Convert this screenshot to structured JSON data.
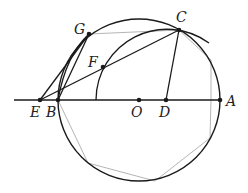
{
  "diagram": {
    "type": "geometry-construction",
    "colors": {
      "ink": "#1a1a1a",
      "polygon": "#b5b5b5",
      "background": "#ffffff"
    },
    "points": [
      {
        "id": "E",
        "label": "E",
        "x": 40,
        "y": 100,
        "label_x": 30,
        "label_y": 117
      },
      {
        "id": "B",
        "label": "B",
        "x": 58,
        "y": 100,
        "label_x": 46,
        "label_y": 117
      },
      {
        "id": "O",
        "label": "O",
        "x": 139,
        "y": 100,
        "label_x": 131,
        "label_y": 117
      },
      {
        "id": "D",
        "label": "D",
        "x": 166,
        "y": 100,
        "label_x": 159,
        "label_y": 117
      },
      {
        "id": "A",
        "label": "A",
        "x": 220,
        "y": 100,
        "label_x": 226,
        "label_y": 106
      },
      {
        "id": "C",
        "label": "C",
        "x": 179,
        "y": 30,
        "label_x": 176,
        "label_y": 22
      },
      {
        "id": "G",
        "label": "G",
        "x": 89,
        "y": 34,
        "label_x": 74,
        "label_y": 34
      },
      {
        "id": "F",
        "label": "F",
        "x": 103,
        "y": 67,
        "label_x": 88,
        "label_y": 67
      }
    ],
    "main_circle": {
      "center": "O",
      "radius": 81
    },
    "inner_arc": {
      "center": "D",
      "radius": 71,
      "through": [
        "C",
        "F"
      ]
    },
    "segments": [
      "E-C",
      "E-G",
      "B-G",
      "D-C",
      "line-E-A"
    ],
    "polygon_gray": [
      [
        58,
        100
      ],
      [
        88,
        163
      ],
      [
        155,
        181
      ],
      [
        210,
        138
      ],
      [
        211,
        100
      ],
      [
        211,
        60
      ],
      [
        179,
        30
      ],
      [
        89,
        34
      ]
    ]
  }
}
